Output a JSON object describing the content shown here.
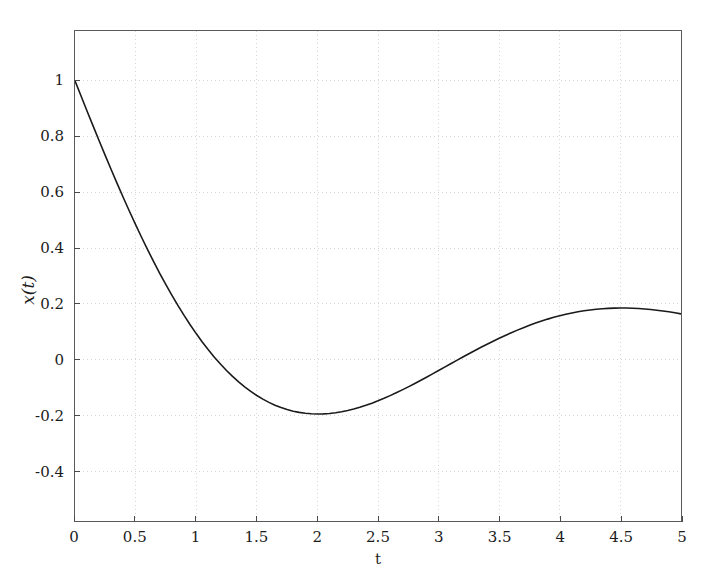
{
  "chart_data": {
    "type": "line",
    "title": "",
    "subtitle": "",
    "xlabel": "t",
    "ylabel": "x(t)",
    "xlim": [
      0,
      5
    ],
    "ylim": [
      -0.5786,
      1.1786
    ],
    "grid": true,
    "grid_style": "dotted",
    "legend": null,
    "legend_position": "none",
    "xticks": [
      0,
      0.5,
      1,
      1.5,
      2,
      2.5,
      3,
      3.5,
      4,
      4.5,
      5
    ],
    "xticklabels": [
      "0",
      "0.5",
      "1",
      "1.5",
      "2",
      "2.5",
      "3",
      "3.5",
      "4",
      "4.5",
      "5"
    ],
    "yticks": [
      1,
      0.8,
      0.6,
      0.4,
      0.2,
      0,
      -0.2,
      -0.4
    ],
    "yticklabels": [
      "1",
      "0.8",
      "0.6",
      "0.4",
      "0.2",
      "0",
      "-0.2",
      "-0.4"
    ],
    "series": [
      {
        "name": "x(t)",
        "color": "#1a1a1a",
        "linewidth": 1.6,
        "annotations": {
          "initial_value": 1.0,
          "first_zero_crossing_t": 1.02,
          "minimum_t": 2.05,
          "minimum_value": -0.5,
          "second_zero_crossing_t": 3.13,
          "maximum_t": 4.35,
          "maximum_value": 0.225,
          "final_value_t5": 0.15
        },
        "x": [
          0,
          0.05,
          0.1,
          0.15,
          0.2,
          0.25,
          0.3,
          0.35,
          0.4,
          0.45,
          0.5,
          0.55,
          0.6,
          0.65,
          0.7,
          0.75,
          0.8,
          0.85,
          0.9,
          0.95,
          1,
          1.05,
          1.1,
          1.15,
          1.2,
          1.25,
          1.3,
          1.35,
          1.4,
          1.45,
          1.5,
          1.55,
          1.6,
          1.65,
          1.7,
          1.75,
          1.8,
          1.85,
          1.9,
          1.95,
          2,
          2.05,
          2.1,
          2.15,
          2.2,
          2.25,
          2.3,
          2.35,
          2.4,
          2.45,
          2.5,
          2.55,
          2.6,
          2.65,
          2.7,
          2.75,
          2.8,
          2.85,
          2.9,
          2.95,
          3,
          3.05,
          3.1,
          3.15,
          3.2,
          3.25,
          3.3,
          3.35,
          3.4,
          3.45,
          3.5,
          3.55,
          3.6,
          3.65,
          3.7,
          3.75,
          3.8,
          3.85,
          3.9,
          3.95,
          4,
          4.05,
          4.1,
          4.15,
          4.2,
          4.25,
          4.3,
          4.35,
          4.4,
          4.45,
          4.5,
          4.55,
          4.6,
          4.65,
          4.7,
          4.75,
          4.8,
          4.85,
          4.9,
          4.95,
          5
        ],
        "y": [
          1.0,
          0.9454,
          0.8911,
          0.8373,
          0.7841,
          0.7316,
          0.68,
          0.6293,
          0.5797,
          0.5312,
          0.484,
          0.4381,
          0.3936,
          0.3505,
          0.3089,
          0.2689,
          0.2305,
          0.1937,
          0.1586,
          0.1252,
          0.0935,
          0.0636,
          0.0354,
          0.0089,
          -0.0158,
          -0.0388,
          -0.0601,
          -0.0797,
          -0.0976,
          -0.1139,
          -0.1286,
          -0.1417,
          -0.1532,
          -0.1632,
          -0.1718,
          -0.1789,
          -0.1847,
          -0.1891,
          -0.1922,
          -0.1941,
          -0.1948,
          -0.1944,
          -0.1929,
          -0.1903,
          -0.1868,
          -0.1823,
          -0.1769,
          -0.1707,
          -0.1637,
          -0.156,
          -0.1476,
          -0.1386,
          -0.129,
          -0.1189,
          -0.1084,
          -0.0975,
          -0.0862,
          -0.0747,
          -0.0629,
          -0.051,
          -0.0389,
          -0.0268,
          -0.0147,
          -0.0026,
          0.0094,
          0.0212,
          0.0328,
          0.0442,
          0.0554,
          0.0662,
          0.0767,
          0.0869,
          0.0966,
          0.1059,
          0.1148,
          0.1232,
          0.1311,
          0.1385,
          0.1454,
          0.1517,
          0.1575,
          0.1628,
          0.1675,
          0.1716,
          0.1752,
          0.1782,
          0.1807,
          0.1826,
          0.184,
          0.1848,
          0.1852,
          0.185,
          0.1844,
          0.1833,
          0.1818,
          0.1798,
          0.1774,
          0.1746,
          0.1715,
          0.168,
          0.1642
        ]
      }
    ]
  },
  "axes": {
    "spine_color": "#5a5a5a",
    "grid_color": "#d6d6d6",
    "tick_color": "#4a4a4a",
    "background_color": "#ffffff",
    "text_color": "#1c1c1c"
  }
}
